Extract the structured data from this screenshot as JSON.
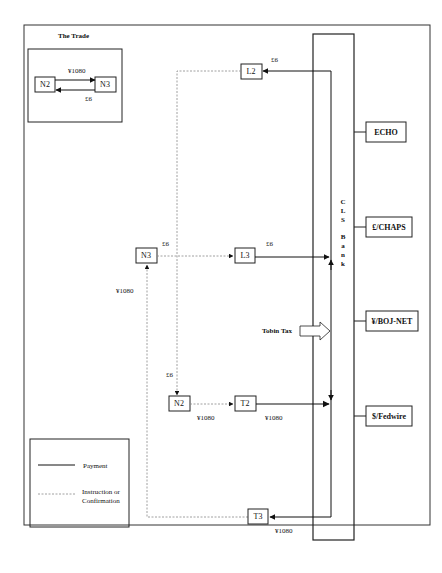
{
  "trade_inset": {
    "title": "The Trade",
    "left_node": "N2",
    "right_node": "N3",
    "top_amount": "¥1080",
    "bottom_amount": "£6"
  },
  "nodes": {
    "l2": "L2",
    "n3": "N3",
    "l3": "L3",
    "n2": "N2",
    "t2": "T2",
    "t3": "T3"
  },
  "amounts": {
    "l2_in": "£6",
    "n3_out": "£6",
    "l3_out": "£6",
    "n3_in": "¥1080",
    "n2_in": "£6",
    "n2_out": "¥1080",
    "t2_out": "¥1080",
    "t3_in": "¥1080"
  },
  "cls_bank": {
    "letters": [
      "C",
      "L",
      "S",
      "",
      "B",
      "a",
      "n",
      "k"
    ]
  },
  "tobin_tax": "Tobin Tax",
  "systems": [
    "ECHO",
    "£/CHAPS",
    "¥/BOJ-NET",
    "$/Fedwire"
  ],
  "legend": {
    "payment": "Payment",
    "instruction_line1": "Instruction or",
    "instruction_line2": "Confirmation"
  },
  "colors": {
    "line": "#1a1a1a",
    "dotted": "#8a8a8a"
  }
}
